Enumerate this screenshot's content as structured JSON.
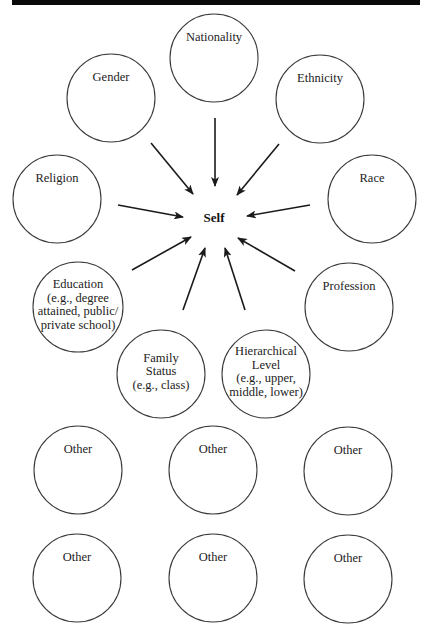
{
  "diagram": {
    "center": {
      "label": "Self",
      "x": 214,
      "y": 218
    },
    "header_bar": {
      "color": "#0a0a0a"
    },
    "nodes": [
      {
        "id": "nationality",
        "label": "Nationality",
        "cx": 214,
        "cy": 58,
        "r": 44
      },
      {
        "id": "gender",
        "label": "Gender",
        "cx": 111,
        "cy": 98,
        "r": 44
      },
      {
        "id": "ethnicity",
        "label": "Ethnicity",
        "cx": 320,
        "cy": 99,
        "r": 44
      },
      {
        "id": "religion",
        "label": "Religion",
        "cx": 57,
        "cy": 199,
        "r": 44
      },
      {
        "id": "race",
        "label": "Race",
        "cx": 372,
        "cy": 199,
        "r": 44
      },
      {
        "id": "education",
        "label": "Education\n(e.g., degree\nattained, public/\nprivate school)",
        "cx": 78,
        "cy": 307,
        "r": 45
      },
      {
        "id": "profession",
        "label": "Profession",
        "cx": 349,
        "cy": 307,
        "r": 44
      },
      {
        "id": "family-status",
        "label": "Family\nStatus\n(e.g., class)",
        "cx": 161,
        "cy": 374,
        "r": 44
      },
      {
        "id": "hierarchical-level",
        "label": "Hierarchical\nLevel\n(e.g., upper,\nmiddle, lower)",
        "cx": 266,
        "cy": 374,
        "r": 44
      },
      {
        "id": "other-1",
        "label": "Other",
        "cx": 78,
        "cy": 470,
        "r": 44
      },
      {
        "id": "other-2",
        "label": "Other",
        "cx": 213,
        "cy": 470,
        "r": 44
      },
      {
        "id": "other-3",
        "label": "Other",
        "cx": 348,
        "cy": 471,
        "r": 44
      },
      {
        "id": "other-4",
        "label": "Other",
        "cx": 77,
        "cy": 578,
        "r": 44
      },
      {
        "id": "other-5",
        "label": "Other",
        "cx": 213,
        "cy": 578,
        "r": 44
      },
      {
        "id": "other-6",
        "label": "Other",
        "cx": 348,
        "cy": 579,
        "r": 44
      }
    ],
    "arrows": [
      {
        "from": "nationality",
        "x1": 215,
        "y1": 118,
        "x2": 215,
        "y2": 186
      },
      {
        "from": "gender",
        "x1": 151,
        "y1": 143,
        "x2": 193,
        "y2": 194
      },
      {
        "from": "ethnicity",
        "x1": 279,
        "y1": 144,
        "x2": 237,
        "y2": 195
      },
      {
        "from": "religion",
        "x1": 118,
        "y1": 205,
        "x2": 183,
        "y2": 217
      },
      {
        "from": "race",
        "x1": 310,
        "y1": 205,
        "x2": 247,
        "y2": 216
      },
      {
        "from": "education",
        "x1": 132,
        "y1": 270,
        "x2": 191,
        "y2": 237
      },
      {
        "from": "profession",
        "x1": 295,
        "y1": 271,
        "x2": 238,
        "y2": 238
      },
      {
        "from": "family-status",
        "x1": 183,
        "y1": 310,
        "x2": 205,
        "y2": 248
      },
      {
        "from": "hierarchical-level",
        "x1": 245,
        "y1": 310,
        "x2": 225,
        "y2": 248
      }
    ]
  }
}
